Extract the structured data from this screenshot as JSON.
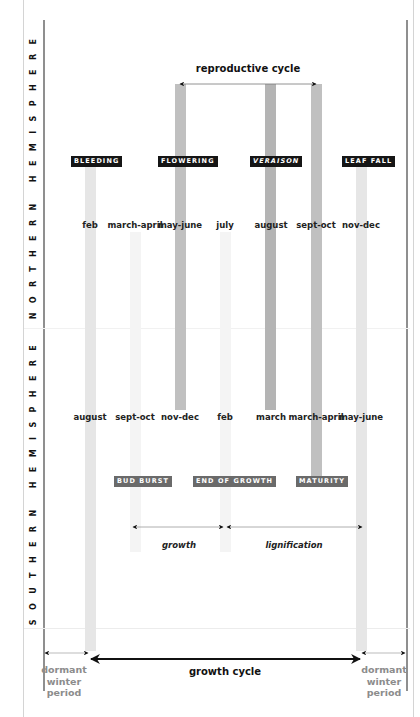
{
  "side_labels": {
    "northern": "NORTHERN HEMISPHERE",
    "southern": "SOUTHERN HEMISPHERE"
  },
  "cycles": {
    "reproductive": "reproductive cycle",
    "growth": "growth",
    "lignification": "lignification",
    "growth_cycle": "growth cycle",
    "dormant_left": [
      "dormant",
      "winter",
      "period"
    ],
    "dormant_right": [
      "dormant",
      "winter",
      "period"
    ]
  },
  "dormant_left": {
    "line1": "dormant",
    "line2": "winter",
    "line3": "period"
  },
  "dormant_right": {
    "line1": "dormant",
    "line2": "winter",
    "line3": "period"
  },
  "stages_top": [
    {
      "label": "BLEEDING",
      "style": "black"
    },
    {
      "label": "FLOWERING",
      "style": "black"
    },
    {
      "label": "VERAISON",
      "style": "black-italic"
    },
    {
      "label": "LEAF FALL",
      "style": "black"
    }
  ],
  "stages_bottom": [
    {
      "label": "BUD BURST",
      "style": "gray"
    },
    {
      "label": "END OF GROWTH",
      "style": "gray"
    },
    {
      "label": "MATURITY",
      "style": "gray"
    }
  ],
  "northern_months": [
    "feb",
    "march-april",
    "may-june",
    "july",
    "august",
    "sept-oct",
    "nov-dec"
  ],
  "southern_months": [
    "august",
    "sept-oct",
    "nov-dec",
    "feb",
    "march",
    "march-april",
    "may-june"
  ],
  "colors": {
    "tag_black": "#151515",
    "tag_gray": "#6a6a6a",
    "bar_dark": "#b4b4b4",
    "bar_light": "#e6e6e6",
    "dormant_text": "#8c8c8c",
    "frame_line": "#8f8f8f"
  }
}
